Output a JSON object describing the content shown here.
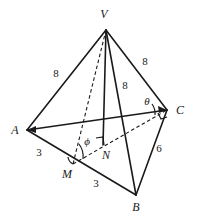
{
  "figure": {
    "background_color": "#ffffff",
    "stroke_color": "#1a1a1a"
  },
  "vertices": [
    {
      "name": "V",
      "label": "V",
      "x": 106,
      "y": 30,
      "label_x": 104,
      "label_y": 14
    },
    {
      "name": "A",
      "label": "A",
      "x": 27,
      "y": 130,
      "label_x": 15,
      "label_y": 130
    },
    {
      "name": "B",
      "label": "B",
      "x": 136,
      "y": 195,
      "label_x": 136,
      "label_y": 207
    },
    {
      "name": "C",
      "label": "C",
      "x": 167,
      "y": 110,
      "label_x": 180,
      "label_y": 110
    },
    {
      "name": "M",
      "label": "M",
      "x": 73,
      "y": 164,
      "label_x": 67,
      "label_y": 174
    },
    {
      "name": "N",
      "label": "N",
      "x": 103,
      "y": 145,
      "label_x": 106,
      "label_y": 155
    }
  ],
  "edges": [
    {
      "name": "edge-VA",
      "from": "V",
      "to": "A",
      "style": "solid"
    },
    {
      "name": "edge-VB",
      "from": "V",
      "to": "B",
      "style": "solid"
    },
    {
      "name": "edge-VC",
      "from": "V",
      "to": "C",
      "style": "solid"
    },
    {
      "name": "edge-AB",
      "from": "A",
      "to": "B",
      "style": "solid"
    },
    {
      "name": "edge-BC",
      "from": "B",
      "to": "C",
      "style": "solid"
    },
    {
      "name": "edge-AC",
      "from": "A",
      "to": "C",
      "style": "solid"
    },
    {
      "name": "edge-VN",
      "from": "V",
      "to": "N",
      "style": "solid"
    },
    {
      "name": "edge-VM",
      "from": "V",
      "to": "M",
      "style": "dashed"
    },
    {
      "name": "edge-MC",
      "from": "M",
      "to": "C",
      "style": "dashed"
    }
  ],
  "length_labels": [
    {
      "name": "length-VA",
      "edge": "VA",
      "value": "8",
      "x": 56,
      "y": 73
    },
    {
      "name": "length-VC",
      "edge": "VC",
      "value": "8",
      "x": 145,
      "y": 61
    },
    {
      "name": "length-VB",
      "edge": "VB",
      "value": "8",
      "x": 125,
      "y": 85
    },
    {
      "name": "length-AM",
      "edge": "AM",
      "value": "3",
      "x": 39,
      "y": 152
    },
    {
      "name": "length-MB",
      "edge": "MB",
      "value": "3",
      "x": 96,
      "y": 183
    },
    {
      "name": "length-BC",
      "edge": "BC",
      "value": "6",
      "x": 159,
      "y": 148
    }
  ],
  "angle_labels": [
    {
      "name": "angle-theta",
      "symbol": "θ",
      "at_vertex": "C",
      "x": 147,
      "y": 101
    },
    {
      "name": "angle-phi",
      "symbol": "ϕ",
      "at_vertex": "M",
      "x": 87,
      "y": 141
    }
  ],
  "right_angle_marks": [
    {
      "name": "right-angle-N",
      "at_vertex": "N",
      "x": 103,
      "y": 145
    },
    {
      "name": "right-angle-C",
      "at_vertex": "C",
      "x": 167,
      "y": 110
    }
  ]
}
